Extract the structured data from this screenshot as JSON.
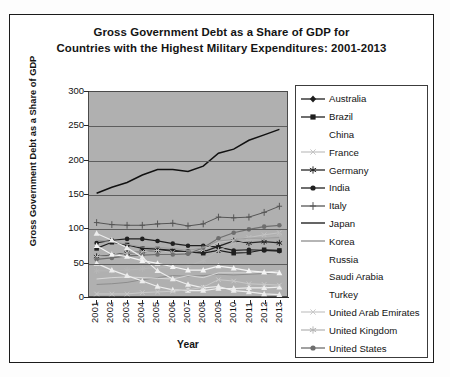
{
  "title": {
    "line1": "Gross Government Debt as a Share of GDP for",
    "line2": "Countries with the Highest Military Expenditures: 2001-2013"
  },
  "axes": {
    "ylabel": "Gross Government Debt as a Share of GDP",
    "xlabel": "Year",
    "yticks": [
      "300",
      "250",
      "200",
      "150",
      "100",
      "50",
      "0"
    ],
    "xticks": [
      "2001",
      "2002",
      "2003",
      "2004",
      "2005",
      "2006",
      "2007",
      "2008",
      "2009",
      "2010",
      "2011",
      "2012",
      "2013"
    ]
  },
  "legend": [
    {
      "label": "Australia",
      "marker": "diamond",
      "color": "#1d1d1d"
    },
    {
      "label": "Brazil",
      "marker": "square",
      "color": "#1f1f1f"
    },
    {
      "label": "China",
      "marker": "none",
      "color": "#d8d8d8"
    },
    {
      "label": "France",
      "marker": "x",
      "color": "#c4c4c4"
    },
    {
      "label": "Germany",
      "marker": "star",
      "color": "#242424"
    },
    {
      "label": "India",
      "marker": "circle",
      "color": "#202020"
    },
    {
      "label": "Italy",
      "marker": "plus",
      "color": "#555555"
    },
    {
      "label": "Japan",
      "marker": "line",
      "color": "#111111"
    },
    {
      "label": "Korea",
      "marker": "line",
      "color": "#8d8d8d"
    },
    {
      "label": "Russia",
      "marker": "none",
      "color": "#ededed"
    },
    {
      "label": "Saudi Arabia",
      "marker": "none",
      "color": "#ededed"
    },
    {
      "label": "Turkey",
      "marker": "none",
      "color": "#f4f4f4"
    },
    {
      "label": "United Arab Emirates",
      "marker": "x",
      "color": "#c9c9c9"
    },
    {
      "label": "United Kingdom",
      "marker": "star",
      "color": "#b6b6b6"
    },
    {
      "label": "United States",
      "marker": "circle",
      "color": "#6e6e6e"
    }
  ],
  "chart_data": {
    "type": "line",
    "title": "Gross Government Debt as a Share of GDP for Countries with the Highest Military Expenditures: 2001-2013",
    "xlabel": "Year",
    "ylabel": "Gross Government Debt as a Share of GDP",
    "ylim": [
      0,
      300
    ],
    "ytick_step": 50,
    "grid": "horizontal",
    "legend_position": "right",
    "plot_background": "#b0b0b0",
    "categories": [
      "2001",
      "2002",
      "2003",
      "2004",
      "2005",
      "2006",
      "2007",
      "2008",
      "2009",
      "2010",
      "2011",
      "2012",
      "2013"
    ],
    "series": [
      {
        "name": "Japan",
        "values": [
          151,
          160,
          167,
          178,
          186,
          186,
          183,
          191,
          210,
          216,
          229,
          237,
          245
        ],
        "color": "#111111",
        "marker": "line",
        "width": 1.5
      },
      {
        "name": "Italy",
        "values": [
          108,
          105,
          104,
          104,
          106,
          107,
          103,
          106,
          116,
          115,
          116,
          123,
          132
        ],
        "color": "#555555",
        "marker": "plus",
        "width": 1.0
      },
      {
        "name": "Germany",
        "values": [
          58,
          60,
          63,
          65,
          67,
          66,
          64,
          65,
          73,
          81,
          78,
          80,
          78
        ],
        "color": "#242424",
        "marker": "star",
        "width": 1.2
      },
      {
        "name": "India",
        "values": [
          78,
          82,
          84,
          84,
          81,
          77,
          74,
          74,
          72,
          67,
          68,
          67,
          66
        ],
        "color": "#202020",
        "marker": "circle",
        "width": 1.2
      },
      {
        "name": "Brazil",
        "values": [
          70,
          79,
          75,
          70,
          69,
          67,
          65,
          63,
          67,
          63,
          64,
          68,
          67
        ],
        "color": "#1f1f1f",
        "marker": "square",
        "width": 1.2
      },
      {
        "name": "France",
        "values": [
          58,
          59,
          63,
          65,
          67,
          64,
          64,
          68,
          79,
          82,
          86,
          90,
          93
        ],
        "color": "#c4c4c4",
        "marker": "x",
        "width": 1.0
      },
      {
        "name": "United States",
        "values": [
          54,
          56,
          59,
          60,
          61,
          61,
          62,
          71,
          85,
          93,
          98,
          102,
          104
        ],
        "color": "#6e6e6e",
        "marker": "circle",
        "width": 1.2
      },
      {
        "name": "United Kingdom",
        "values": [
          37,
          37,
          38,
          40,
          42,
          42,
          44,
          52,
          67,
          77,
          82,
          85,
          90
        ],
        "color": "#b6b6b6",
        "marker": "star",
        "width": 1.0
      },
      {
        "name": "Canada",
        "values": [
          82,
          80,
          76,
          72,
          71,
          70,
          67,
          71,
          81,
          83,
          85,
          85,
          86
        ],
        "color": "#9c9c9c",
        "marker": "none",
        "width": 1.0
      },
      {
        "name": "Korea",
        "values": [
          17,
          18,
          20,
          24,
          27,
          30,
          29,
          30,
          32,
          31,
          32,
          33,
          35
        ],
        "color": "#8d8d8d",
        "marker": "line",
        "width": 1.0
      },
      {
        "name": "China",
        "values": [
          25,
          27,
          28,
          27,
          26,
          25,
          30,
          27,
          34,
          34,
          34,
          35,
          37
        ],
        "color": "#d8d8d8",
        "marker": "none",
        "width": 1.0
      },
      {
        "name": "Turkey",
        "values": [
          74,
          61,
          58,
          52,
          48,
          43,
          38,
          38,
          44,
          41,
          37,
          35,
          34
        ],
        "color": "#f4f4f4",
        "marker": "triangle",
        "width": 1.2
      },
      {
        "name": "Russia",
        "values": [
          48,
          38,
          30,
          22,
          14,
          9,
          8,
          8,
          11,
          11,
          12,
          12,
          13
        ],
        "color": "#ededed",
        "marker": "triangle",
        "width": 1.2
      },
      {
        "name": "Saudi Arabia",
        "values": [
          92,
          82,
          71,
          57,
          37,
          25,
          17,
          12,
          14,
          8,
          6,
          3,
          2
        ],
        "color": "#ededed",
        "marker": "triangle",
        "width": 1.2
      },
      {
        "name": "United Arab Emirates",
        "values": [
          3,
          3,
          3,
          5,
          6,
          7,
          9,
          13,
          24,
          22,
          18,
          17,
          16
        ],
        "color": "#c9c9c9",
        "marker": "x",
        "width": 1.0
      }
    ]
  }
}
